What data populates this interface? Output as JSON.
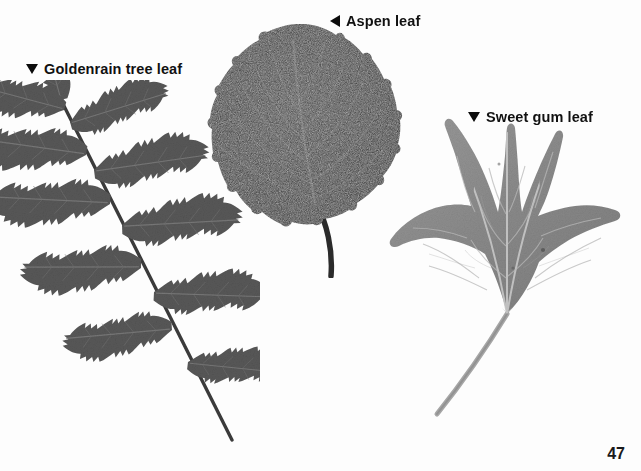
{
  "page": {
    "background_color": "#fdfdfd",
    "page_number": "47"
  },
  "labels": {
    "goldenrain": {
      "text": "Goldenrain tree leaf",
      "marker": "triangle-down-icon",
      "color": "#111111"
    },
    "aspen": {
      "text": "Aspen leaf",
      "marker": "triangle-left-icon",
      "color": "#111111"
    },
    "sweetgum": {
      "text": "Sweet gum leaf",
      "marker": "triangle-down-icon",
      "color": "#111111"
    }
  },
  "specimens": [
    {
      "name": "goldenrain-tree-leaf",
      "leaf_type": "compound pinnate",
      "fill_color": "#585858",
      "vein_color": "#7c7c7c",
      "stem_color": "#3d3d3d",
      "leaflet_count": 11
    },
    {
      "name": "aspen-leaf",
      "leaf_type": "simple ovate, crenate margin",
      "fill_color": "#3b3b3b",
      "vein_color": "#6f6f6f",
      "stem_color": "#2c2c2c"
    },
    {
      "name": "sweet-gum-leaf",
      "leaf_type": "simple palmate, five lobes",
      "fill_color": "#8c8c8c",
      "vein_color": "#c9c9c9",
      "stem_color": "#a9a9a9",
      "lobe_count": 5
    }
  ]
}
